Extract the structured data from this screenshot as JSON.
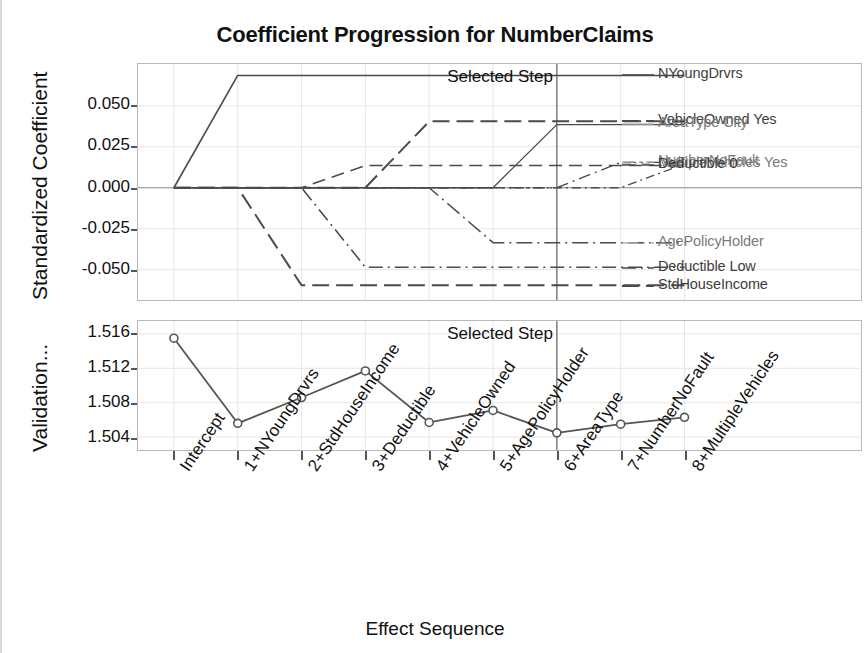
{
  "chart_data": {
    "type": "line",
    "title": "Coefficient Progression for NumberClaims",
    "xlabel": "Effect Sequence",
    "categories": [
      "Intercept",
      "1+NYoungDrvrs",
      "2+StdHouseIncome",
      "3+Deductible",
      "4+VehicleOwned",
      "5+AgePolicyHolder",
      "6+AreaType",
      "7+NumberNoFault",
      "8+MultipleVehicles"
    ],
    "panels": [
      {
        "name": "coefficient-panel",
        "ylabel": "Standardized Coefficient",
        "yticks": [
          "0.050",
          "0.025",
          "0.000",
          "-0.025",
          "-0.050"
        ],
        "ytick_values": [
          0.05,
          0.025,
          0.0,
          -0.025,
          -0.05
        ],
        "ylim": [
          -0.0685,
          0.0755
        ],
        "annotation": "Selected Step",
        "selected_step_index": 6,
        "zero_reference_line": 0.0,
        "series": [
          {
            "name": "NYoungDrvrs",
            "style": "solid",
            "values": [
              0.0,
              0.0685,
              0.0685,
              0.0685,
              0.0685,
              0.0685,
              0.0685,
              0.0685,
              0.0685
            ]
          },
          {
            "name": "VehicleOwned Yes",
            "style": "long-dash",
            "values": [
              0.0,
              0.0,
              0.0,
              0.0,
              0.0405,
              0.0405,
              0.0405,
              0.0405,
              0.0405
            ]
          },
          {
            "name": "AreaType City",
            "style": "solid-thin",
            "values": [
              0.0,
              0.0,
              0.0,
              0.0,
              0.0,
              0.0,
              0.0385,
              0.0385,
              0.0385
            ]
          },
          {
            "name": "NumberNoFault",
            "style": "dash-dot",
            "values": [
              0.0,
              0.0,
              0.0,
              0.0,
              0.0,
              0.0,
              0.0,
              0.0155,
              0.0155
            ]
          },
          {
            "name": "MultipleVehicles Yes",
            "style": "dash-dot-fine",
            "values": [
              0.0,
              0.0,
              0.0,
              0.0,
              0.0,
              0.0,
              0.0,
              0.0,
              0.0145
            ]
          },
          {
            "name": "Deductible 0",
            "style": "dashed",
            "values": [
              0.0,
              0.0,
              0.0,
              0.0135,
              0.0135,
              0.0135,
              0.0135,
              0.0135,
              0.0135
            ]
          },
          {
            "name": "AgePolicyHolder",
            "style": "dash-dot-long",
            "values": [
              0.0,
              0.0,
              0.0,
              0.0,
              0.0,
              -0.0335,
              -0.0335,
              -0.0335,
              -0.0335
            ]
          },
          {
            "name": "Deductible Low",
            "style": "dash-dot-2",
            "values": [
              0.0,
              0.0,
              0.0,
              -0.0485,
              -0.0485,
              -0.0485,
              -0.0485,
              -0.0485,
              -0.0485
            ]
          },
          {
            "name": "StdHouseIncome",
            "style": "long-dash-2",
            "values": [
              0.0,
              0.0,
              -0.0595,
              -0.0595,
              -0.0595,
              -0.0595,
              -0.0595,
              -0.0595,
              -0.0595
            ]
          }
        ]
      },
      {
        "name": "validation-panel",
        "ylabel": "Validation...",
        "yticks": [
          "1.516",
          "1.512",
          "1.508",
          "1.504"
        ],
        "ytick_values": [
          1.516,
          1.512,
          1.508,
          1.504
        ],
        "ylim": [
          1.5025,
          1.5175
        ],
        "annotation": "Selected Step",
        "selected_step_index": 6,
        "markers": "open-circle",
        "series": [
          {
            "name": "Validation",
            "style": "solid-marker",
            "values": [
              1.5155,
              1.5056,
              1.5086,
              1.5117,
              1.5057,
              1.5071,
              1.5045,
              1.5055,
              1.5063
            ]
          }
        ]
      }
    ],
    "legend": [
      {
        "label": "NYoungDrvrs",
        "style": "solid",
        "tone": "dark"
      },
      {
        "label": "VehicleOwned Yes",
        "style": "long-dash",
        "tone": "dark"
      },
      {
        "label": "AreaType City",
        "style": "solid-thin",
        "tone": "light"
      },
      {
        "label": "NumberNoFault",
        "style": "dash-dot",
        "tone": "light"
      },
      {
        "label": "MultipleVehicles Yes",
        "style": "dash-dot-fine",
        "tone": "light"
      },
      {
        "label": "Deductible 0",
        "style": "dashed",
        "tone": "dark"
      },
      {
        "label": "AgePolicyHolder",
        "style": "dash-dot-long",
        "tone": "light"
      },
      {
        "label": "Deductible Low",
        "style": "dash-dot-2",
        "tone": "dark"
      },
      {
        "label": "StdHouseIncome",
        "style": "long-dash-2",
        "tone": "dark"
      }
    ],
    "colors": {
      "line": "#4a4a4a",
      "grid": "#e6e6e6",
      "axis": "#b9b9b9",
      "text": "#111111",
      "legend_light": "#9a9a9a",
      "legend_dark": "#3d3d3d"
    }
  }
}
